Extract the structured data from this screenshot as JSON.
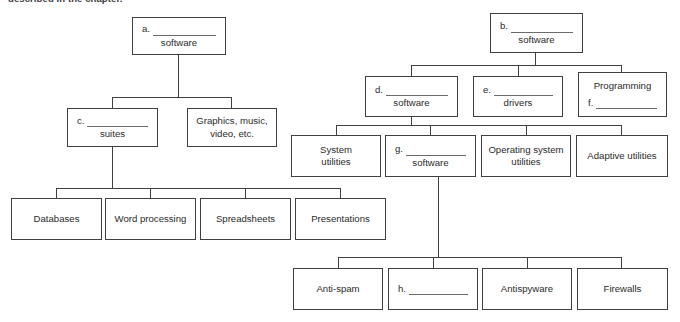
{
  "page": {
    "caption": "described in the chapter."
  },
  "diagram": {
    "type": "fill-in-the-blank concept map",
    "trees": [
      {
        "id": "left-tree",
        "root": {
          "blank_label": "a.",
          "suffix": "software"
        },
        "children": [
          {
            "blank_label": "c.",
            "suffix": "suites"
          },
          {
            "text_line1": "Graphics, music,",
            "text_line2": "video, etc."
          }
        ],
        "grandchildren": [
          "Databases",
          "Word processing",
          "Spreadsheets",
          "Presentations"
        ]
      },
      {
        "id": "right-tree",
        "root": {
          "blank_label": "b.",
          "suffix": "software"
        },
        "children": [
          {
            "blank_label": "d.",
            "suffix": "software"
          },
          {
            "blank_label": "e.",
            "suffix": "drivers"
          },
          {
            "text_line1": "Programming",
            "blank_label": "f."
          }
        ],
        "grandchildren": [
          {
            "text_line1": "System",
            "text_line2": "utilities"
          },
          {
            "blank_label": "g.",
            "suffix": "software"
          },
          {
            "text_line1": "Operating system",
            "text_line2": "utilities"
          },
          {
            "text_line1": "Adaptive utilities"
          }
        ],
        "great_grandchildren": [
          "Anti-spam",
          {
            "blank_label": "h."
          },
          "Antispyware",
          "Firewalls"
        ]
      }
    ]
  },
  "nodes": {
    "a": {
      "blank": "a.",
      "sub": "software"
    },
    "b": {
      "blank": "b.",
      "sub": "software"
    },
    "c": {
      "blank": "c.",
      "sub": "suites"
    },
    "d": {
      "blank": "d.",
      "sub": "software"
    },
    "e": {
      "blank": "e.",
      "sub": "drivers"
    },
    "f": {
      "top": "Programming",
      "blank": "f."
    },
    "g": {
      "blank": "g.",
      "sub": "software"
    },
    "h": {
      "blank": "h."
    },
    "graphics": {
      "line1": "Graphics, music,",
      "line2": "video, etc."
    },
    "databases": {
      "line1": "Databases"
    },
    "word_processing": {
      "line1": "Word processing"
    },
    "spreadsheets": {
      "line1": "Spreadsheets"
    },
    "presentations": {
      "line1": "Presentations"
    },
    "system_utilities": {
      "line1": "System",
      "line2": "utilities"
    },
    "os_utilities": {
      "line1": "Operating system",
      "line2": "utilities"
    },
    "adaptive_utilities": {
      "line1": "Adaptive utilities"
    },
    "anti_spam": {
      "line1": "Anti-spam"
    },
    "antispyware": {
      "line1": "Antispyware"
    },
    "firewalls": {
      "line1": "Firewalls"
    }
  },
  "colors": {
    "border": "#404040",
    "text": "#2b2b2b",
    "rule": "#6b6b6b",
    "background": "#ffffff"
  }
}
